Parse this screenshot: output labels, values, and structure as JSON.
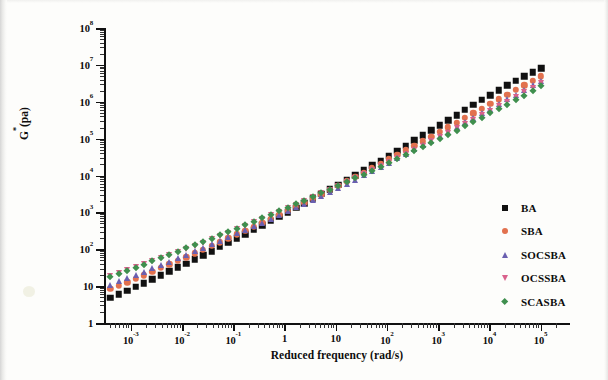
{
  "figure": {
    "axis_titles": {
      "x": "Reduced frequency (rad/s)",
      "y_main": "G",
      "y_star": "*",
      "y_unit": "(pa)"
    },
    "x_ticks": [
      {
        "label": "10",
        "exp": "-3",
        "decade": -3
      },
      {
        "label": "10",
        "exp": "-2",
        "decade": -2
      },
      {
        "label": "10",
        "exp": "-1",
        "decade": -1
      },
      {
        "label": "1",
        "exp": "",
        "decade": 0
      },
      {
        "label": "10",
        "exp": "",
        "decade": 1
      },
      {
        "label": "10",
        "exp": "2",
        "decade": 2
      },
      {
        "label": "10",
        "exp": "3",
        "decade": 3
      },
      {
        "label": "10",
        "exp": "4",
        "decade": 4
      },
      {
        "label": "10",
        "exp": "5",
        "decade": 5
      }
    ],
    "y_ticks": [
      {
        "label": "1",
        "exp": "",
        "decade": 0
      },
      {
        "label": "10",
        "exp": "",
        "decade": 1
      },
      {
        "label": "10",
        "exp": "2",
        "decade": 2
      },
      {
        "label": "10",
        "exp": "3",
        "decade": 3
      },
      {
        "label": "10",
        "exp": "4",
        "decade": 4
      },
      {
        "label": "10",
        "exp": "5",
        "decade": 5
      },
      {
        "label": "10",
        "exp": "6",
        "decade": 6
      },
      {
        "label": "10",
        "exp": "7",
        "decade": 7
      },
      {
        "label": "10",
        "exp": "8",
        "decade": 8
      }
    ],
    "legend": [
      {
        "label": "BA",
        "marker": "square",
        "color": "#111111"
      },
      {
        "label": "SBA",
        "marker": "circle",
        "color": "#e2714e"
      },
      {
        "label": "SOCSBA",
        "marker": "triangle-up",
        "color": "#6a5fb0"
      },
      {
        "label": "OCSSBA",
        "marker": "triangle-down",
        "color": "#d9618c"
      },
      {
        "label": "SCASBA",
        "marker": "diamond",
        "color": "#3f8f4e"
      }
    ]
  },
  "chart_data": {
    "type": "scatter",
    "title": "",
    "xlabel": "Reduced frequency (rad/s)",
    "ylabel": "G*(pa)",
    "xscale": "log",
    "yscale": "log",
    "xlim": [
      0.0003,
      200000
    ],
    "ylim": [
      1,
      100000000
    ],
    "grid": false,
    "legend_position": "lower-right-inside",
    "x": [
      0.0004,
      0.00058,
      0.00085,
      0.00124,
      0.0018,
      0.00264,
      0.00386,
      0.00564,
      0.00825,
      0.01206,
      0.01763,
      0.02578,
      0.03769,
      0.0551,
      0.08056,
      0.11779,
      0.17223,
      0.2518,
      0.36814,
      0.53822,
      0.78689,
      1.15039,
      1.6818,
      2.45871,
      3.59436,
      5.25453,
      7.68192,
      11.2312,
      16.4175,
      24.0008,
      35.0894,
      51.3,
      74.9983,
      109.655,
      160.332,
      234.422,
      342.727,
      501.054,
      732.504,
      1070.68,
      1565.29,
      2288.44,
      3345.44,
      4891.14,
      7150.32,
      10454.0,
      15283.1,
      22343.6,
      32667.4,
      47757.9,
      69821.1,
      102081.0
    ],
    "series": [
      {
        "name": "BA",
        "marker": "square",
        "color": "#111111",
        "values": [
          4.8,
          6.0,
          7.6,
          9.6,
          12.1,
          15.4,
          19.6,
          25.0,
          32.0,
          41.0,
          53.0,
          68.5,
          89.0,
          116,
          151,
          197,
          258,
          338,
          444,
          585,
          772,
          1020,
          1350,
          1790,
          2380,
          3170,
          4230,
          5660,
          7590,
          10200,
          13800,
          18700,
          25400,
          34600,
          47300,
          64800,
          89000,
          122000,
          168000,
          231000,
          318000,
          437000,
          600000,
          821000,
          1120000,
          1520000,
          2060000,
          2770000,
          3690000,
          4860000,
          6300000,
          8000000
        ]
      },
      {
        "name": "SBA",
        "marker": "circle",
        "color": "#e2714e",
        "values": [
          8.4,
          10.3,
          12.8,
          15.9,
          19.8,
          24.7,
          30.9,
          38.7,
          48.6,
          61.2,
          77.2,
          97.5,
          123,
          156,
          198,
          252,
          321,
          410,
          525,
          673,
          864,
          1110,
          1430,
          1850,
          2400,
          3120,
          4060,
          5300,
          6930,
          9080,
          11900,
          15700,
          20700,
          27400,
          36300,
          48200,
          64100,
          85400,
          114000,
          152000,
          203000,
          272000,
          364000,
          488000,
          654000,
          876000,
          1170000,
          1570000,
          2090000,
          2780000,
          3680000,
          4850000
        ]
      },
      {
        "name": "SOCSBA",
        "marker": "triangle-up",
        "color": "#6a5fb0",
        "values": [
          11.0,
          13.4,
          16.4,
          20.1,
          24.7,
          30.4,
          37.5,
          46.3,
          57.3,
          71.0,
          88.2,
          110,
          137,
          171,
          214,
          268,
          336,
          422,
          531,
          669,
          845,
          1070,
          1360,
          1730,
          2210,
          2830,
          3630,
          4670,
          6020,
          7780,
          10100,
          13100,
          17100,
          22400,
          29400,
          38600,
          50800,
          67000,
          88500,
          117000,
          155000,
          206000,
          274000,
          365000,
          487000,
          650000,
          868000,
          1160000,
          1550000,
          2070000,
          2760000,
          3690000
        ]
      },
      {
        "name": "OCSSBA",
        "marker": "triangle-down",
        "color": "#d9618c",
        "values": [
          18.5,
          22.2,
          26.7,
          32.2,
          38.9,
          47.0,
          56.9,
          69.0,
          83.8,
          102,
          124,
          152,
          186,
          229,
          282,
          348,
          430,
          533,
          662,
          824,
          1030,
          1290,
          1620,
          2040,
          2570,
          3250,
          4120,
          5230,
          6650,
          8470,
          10800,
          13900,
          17800,
          23000,
          29700,
          38500,
          50000,
          65000,
          84800,
          111000,
          145000,
          190000,
          250000,
          329000,
          434000,
          573000,
          759000,
          1010000,
          1340000,
          1790000,
          2400000,
          3220000
        ]
      },
      {
        "name": "SCASBA",
        "marker": "diamond",
        "color": "#3f8f4e",
        "values": [
          17.5,
          21.3,
          25.9,
          31.6,
          38.5,
          47.0,
          57.4,
          70.2,
          85.9,
          105,
          129,
          158,
          194,
          239,
          294,
          363,
          448,
          554,
          686,
          851,
          1060,
          1320,
          1650,
          2070,
          2600,
          3270,
          4120,
          5200,
          6570,
          8310,
          10500,
          13400,
          17000,
          21700,
          27700,
          35500,
          45600,
          58700,
          75700,
          97900,
          127000,
          165000,
          215000,
          281000,
          368000,
          483000,
          636000,
          838000,
          1110000,
          1470000,
          1960000,
          2620000
        ]
      }
    ]
  }
}
